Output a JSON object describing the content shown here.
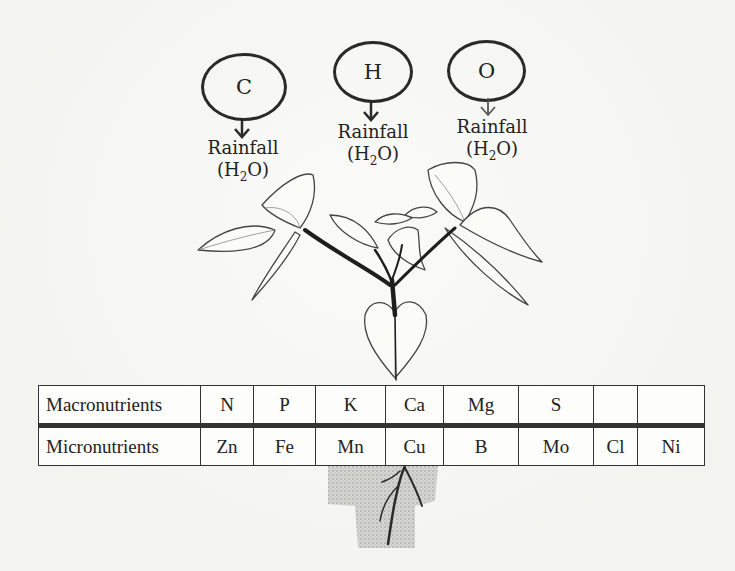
{
  "diagram": {
    "sources": [
      {
        "element": "C",
        "label": "Rainfall",
        "formula_main": "(H",
        "formula_sub": "2",
        "formula_end": "O)"
      },
      {
        "element": "H",
        "label": "Rainfall",
        "formula_main": "(H",
        "formula_sub": "2",
        "formula_end": "O)"
      },
      {
        "element": "O",
        "label": "Rainfall",
        "formula_main": "(H",
        "formula_sub": "2",
        "formula_end": "O)"
      }
    ],
    "illustration": "plant-with-leaves-and-roots",
    "table": {
      "rows": [
        {
          "header": "Macronutrients",
          "cells": [
            "N",
            "P",
            "K",
            "Ca",
            "Mg",
            "S",
            "",
            ""
          ]
        },
        {
          "header": "Micronutrients",
          "cells": [
            "Zn",
            "Fe",
            "Mn",
            "Cu",
            "B",
            "Mo",
            "Cl",
            "Ni"
          ]
        }
      ]
    },
    "colors": {
      "ink": "#222222",
      "background": "#f7f7f5"
    }
  }
}
